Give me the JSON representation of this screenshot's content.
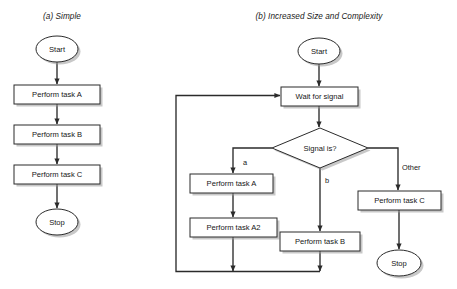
{
  "figure": {
    "kind": "flowchart-comparison",
    "panels": [
      {
        "id": "a",
        "title": "(a) Simple",
        "title_x": 62,
        "title_y": 19,
        "nodes": [
          {
            "name": "start",
            "type": "terminator",
            "label": "Start",
            "cx": 57,
            "cy": 49,
            "rx": 21,
            "ry": 13
          },
          {
            "name": "task-a",
            "type": "process",
            "label": "Perform task A",
            "x": 14,
            "y": 85,
            "w": 86,
            "h": 19
          },
          {
            "name": "task-b",
            "type": "process",
            "label": "Perform task B",
            "x": 14,
            "y": 125,
            "w": 86,
            "h": 19
          },
          {
            "name": "task-c",
            "type": "process",
            "label": "Perform task C",
            "x": 14,
            "y": 165,
            "w": 86,
            "h": 19
          },
          {
            "name": "stop",
            "type": "terminator",
            "label": "Stop",
            "cx": 57,
            "cy": 222,
            "rx": 21,
            "ry": 13
          }
        ],
        "edges": [
          {
            "name": "start-to-task-a",
            "points": "57,62 57,84"
          },
          {
            "name": "task-a-to-task-b",
            "points": "57,104 57,124"
          },
          {
            "name": "task-b-to-task-c",
            "points": "57,144 57,164"
          },
          {
            "name": "task-c-to-stop",
            "points": "57,184 57,208"
          }
        ],
        "edge_labels": []
      },
      {
        "id": "b",
        "title": "(b) Increased Size and Complexity",
        "title_x": 319,
        "title_y": 19,
        "nodes": [
          {
            "name": "start",
            "type": "terminator",
            "label": "Start",
            "cx": 319,
            "cy": 51,
            "rx": 21,
            "ry": 13
          },
          {
            "name": "wait-for-signal",
            "type": "process",
            "label": "Wait for signal",
            "x": 281,
            "y": 87,
            "w": 77,
            "h": 19
          },
          {
            "name": "signal-decision",
            "type": "decision",
            "label": "Signal is?",
            "cx": 320,
            "cy": 148,
            "rx": 48,
            "ry": 20
          },
          {
            "name": "task-a",
            "type": "process",
            "label": "Perform task A",
            "x": 190,
            "y": 174,
            "w": 83,
            "h": 19
          },
          {
            "name": "task-a2",
            "type": "process",
            "label": "Perform task A2",
            "x": 190,
            "y": 218,
            "w": 87,
            "h": 19
          },
          {
            "name": "task-b",
            "type": "process",
            "label": "Perform task B",
            "x": 280,
            "y": 232,
            "w": 80,
            "h": 19
          },
          {
            "name": "task-c",
            "type": "process",
            "label": "Perform task C",
            "x": 358,
            "y": 191,
            "w": 83,
            "h": 19
          },
          {
            "name": "stop",
            "type": "terminator",
            "label": "Stop",
            "cx": 399,
            "cy": 263,
            "rx": 22,
            "ry": 13
          }
        ],
        "edges": [
          {
            "name": "start-to-wait",
            "points": "319,64 319,86"
          },
          {
            "name": "wait-to-decision",
            "points": "319,106 319,127"
          },
          {
            "name": "decision-branch-a",
            "points": "272,148 233,148 233,173"
          },
          {
            "name": "decision-branch-b",
            "points": "320,168 320,231"
          },
          {
            "name": "decision-branch-other",
            "points": "368,148 398,148 398,190"
          },
          {
            "name": "task-a-to-task-a2",
            "points": "233,193 233,217"
          },
          {
            "name": "task-a2-to-return",
            "points": "233,237 233,271"
          },
          {
            "name": "task-b-to-return",
            "points": "320,251 320,271"
          },
          {
            "name": "task-c-to-stop",
            "points": "399,210 399,249"
          },
          {
            "name": "return-loop",
            "points": "320,271.5 176,271.5 176,95.5 280,95.5"
          }
        ],
        "edge_labels": [
          {
            "name": "branch-label-a",
            "text": "a",
            "x": 243,
            "y": 163
          },
          {
            "name": "branch-label-b",
            "text": "b",
            "x": 325,
            "y": 181
          },
          {
            "name": "branch-label-other",
            "text": "Other",
            "x": 402,
            "y": 168
          }
        ]
      }
    ],
    "colors": {
      "stroke": "#2b2b2b",
      "fill": "#ffffff",
      "text": "#161616",
      "background": "#ffffff",
      "shadow": "#9a9a9a"
    }
  }
}
